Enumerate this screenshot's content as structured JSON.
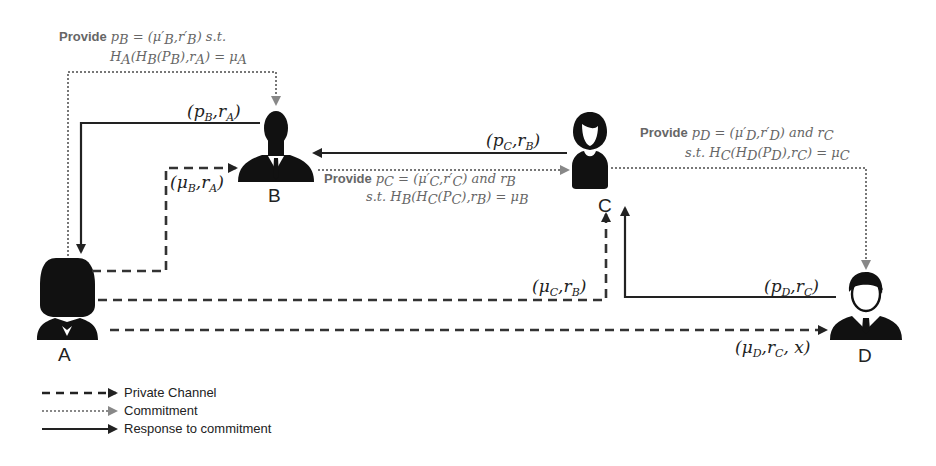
{
  "actors": {
    "A": {
      "label": "A"
    },
    "B": {
      "label": "B"
    },
    "C": {
      "label": "C"
    },
    "D": {
      "label": "D"
    }
  },
  "edges": {
    "b_to_a_response": {
      "label": "(p_B, r_A)",
      "text_main": "(p",
      "sub1": "B",
      "mid": ",r",
      "sub2": "A",
      "end": ")"
    },
    "a_to_b_private": {
      "text_main": "(μ",
      "sub1": "B",
      "mid": ",r",
      "sub2": "A",
      "end": ")"
    },
    "c_to_b_response": {
      "text_main": "(p",
      "sub1": "C",
      "mid": ",r",
      "sub2": "B",
      "end": ")"
    },
    "a_to_c_private": {
      "text_main": "(μ",
      "sub1": "C",
      "mid": ",r",
      "sub2": "B",
      "end": ")"
    },
    "d_to_c_response": {
      "text_main": "(p",
      "sub1": "D",
      "mid": ",r",
      "sub2": "C",
      "end": ")"
    },
    "a_to_d_private": {
      "text_main": "(μ",
      "sub1": "D",
      "mid": ",r",
      "sub2": "C",
      "end": ", x)"
    }
  },
  "commitments": {
    "a_to_b": {
      "provide": "Provide",
      "line1": "p_B = (μ'_B, r'_B) s.t.",
      "line1_math": "p",
      "line2": "H_A(H_B(P_B), r_A) = μ_A"
    },
    "b_to_c": {
      "provide": "Provide",
      "line1": "p_C = (μ'_C, r'_C) and r_B",
      "line2": "s.t. H_B(H_C(P_C), r_B) = μ_B"
    },
    "c_to_d": {
      "provide": "Provide",
      "line1": "p_D = (μ'_D, r'_D) and r_C",
      "line2": "s.t. H_C(H_D(P_D), r_C) = μ_C"
    }
  },
  "legend": {
    "items": [
      {
        "style": "dashed",
        "label": "Private Channel"
      },
      {
        "style": "dotted",
        "label": "Commitment"
      },
      {
        "style": "solid",
        "label": "Response to commitment"
      }
    ]
  },
  "colors": {
    "ink": "#111111",
    "commitment_gray": "#777777",
    "annotation_gray": "#666666"
  }
}
